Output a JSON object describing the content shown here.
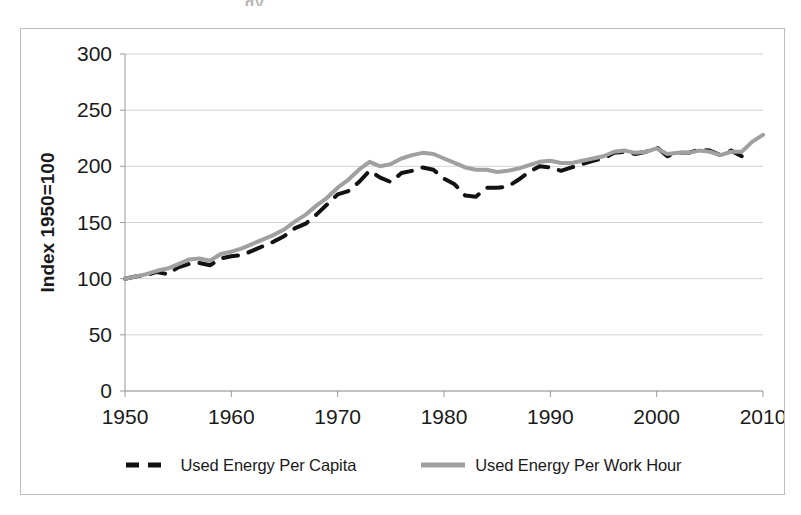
{
  "scan": {
    "top_artifact_text": "gy"
  },
  "legend": {
    "position": "bottom-center",
    "entries": [
      {
        "label": "Used Energy Per Capita",
        "color": "#121212",
        "style": "dashed",
        "icon": "legend-dashed-line-icon"
      },
      {
        "label": "Used Energy Per Work Hour",
        "color": "#a0a0a0",
        "style": "solid",
        "icon": "legend-solid-line-icon"
      }
    ]
  },
  "chart_data": {
    "type": "line",
    "title": "",
    "subtitle": "",
    "xlabel": "",
    "ylabel": "Index 1950=100",
    "xlim": [
      1950,
      2010
    ],
    "ylim": [
      0,
      300
    ],
    "xticks": [
      1950,
      1960,
      1970,
      1980,
      1990,
      2000,
      2010
    ],
    "yticks": [
      0,
      50,
      100,
      150,
      200,
      250,
      300
    ],
    "xtick_labels": [
      "1950",
      "1960",
      "1970",
      "1980",
      "1990",
      "2000",
      "2010"
    ],
    "ytick_labels": [
      "0",
      "50",
      "100",
      "150",
      "200",
      "250",
      "300"
    ],
    "grid": {
      "horizontal": true,
      "vertical": false,
      "color": "#d4d4d4"
    },
    "plot_background": "#ffffff",
    "border_color": "#bdbdbd",
    "axis_color": "#9a9a9a",
    "series": [
      {
        "name": "Used Energy Per Capita",
        "color": "#121212",
        "style": "dashed",
        "linewidth": 4,
        "x": [
          1950,
          1951,
          1952,
          1953,
          1954,
          1955,
          1956,
          1957,
          1958,
          1959,
          1960,
          1961,
          1962,
          1963,
          1964,
          1965,
          1966,
          1967,
          1968,
          1969,
          1970,
          1971,
          1972,
          1973,
          1974,
          1975,
          1976,
          1977,
          1978,
          1979,
          1980,
          1981,
          1982,
          1983,
          1984,
          1985,
          1986,
          1987,
          1988,
          1989,
          1990,
          1991,
          1992,
          1993,
          1994,
          1995,
          1996,
          1997,
          1998,
          1999,
          2000,
          2001,
          2002,
          2003,
          2004,
          2005,
          2006,
          2007,
          2008
        ],
        "values": [
          100,
          102,
          103,
          106,
          104,
          110,
          113,
          114,
          112,
          118,
          120,
          121,
          125,
          129,
          133,
          138,
          145,
          149,
          157,
          166,
          175,
          178,
          186,
          196,
          190,
          186,
          194,
          196,
          199,
          197,
          189,
          184,
          174,
          173,
          181,
          181,
          182,
          188,
          195,
          200,
          199,
          196,
          199,
          202,
          205,
          207,
          212,
          213,
          211,
          213,
          217,
          209,
          212,
          212,
          215,
          214,
          210,
          214,
          209
        ]
      },
      {
        "name": "Used Energy Per Work Hour",
        "color": "#a0a0a0",
        "style": "solid",
        "linewidth": 4,
        "x": [
          1950,
          1951,
          1952,
          1953,
          1954,
          1955,
          1956,
          1957,
          1958,
          1959,
          1960,
          1961,
          1962,
          1963,
          1964,
          1965,
          1966,
          1967,
          1968,
          1969,
          1970,
          1971,
          1972,
          1973,
          1974,
          1975,
          1976,
          1977,
          1978,
          1979,
          1980,
          1981,
          1982,
          1983,
          1984,
          1985,
          1986,
          1987,
          1988,
          1989,
          1990,
          1991,
          1992,
          1993,
          1994,
          1995,
          1996,
          1997,
          1998,
          1999,
          2000,
          2001,
          2002,
          2003,
          2004,
          2005,
          2006,
          2007,
          2008,
          2009,
          2010
        ],
        "values": [
          100,
          102,
          104,
          107,
          109,
          113,
          117,
          118,
          116,
          122,
          124,
          127,
          131,
          135,
          139,
          144,
          151,
          157,
          165,
          172,
          181,
          188,
          197,
          204,
          200,
          202,
          207,
          210,
          212,
          211,
          207,
          203,
          199,
          197,
          197,
          195,
          196,
          198,
          201,
          204,
          205,
          203,
          203,
          205,
          207,
          209,
          213,
          214,
          212,
          213,
          216,
          211,
          212,
          212,
          214,
          213,
          210,
          213,
          213,
          222,
          228
        ]
      }
    ],
    "rendered_series_note": {
      "capita_label": "Used Energy Per Capita",
      "workhour_label": "Used Energy Per Work Hour"
    },
    "annotations": []
  }
}
